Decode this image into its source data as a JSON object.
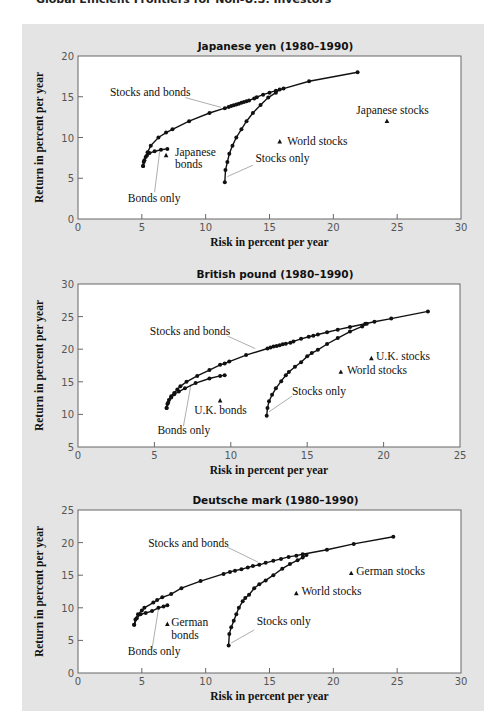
{
  "page": {
    "top_caption": "Global Efficient Frontiers for Non-U.S. Investors"
  },
  "chart_data": [
    {
      "type": "line",
      "title": "Japanese yen (1980–1990)",
      "xlabel": "Risk in percent per year",
      "ylabel": "Return in percent per year",
      "xlim": [
        0,
        30
      ],
      "ylim": [
        0,
        20
      ],
      "xticks": [
        0,
        5,
        10,
        15,
        20,
        25,
        30
      ],
      "yticks": [
        0,
        5,
        10,
        15,
        20
      ],
      "grid": false,
      "plot_box": {
        "left": 78,
        "top": 56,
        "right": 461,
        "bottom": 219
      },
      "series": [
        {
          "name": "Stocks and bonds",
          "points": [
            [
              5.1,
              6.5
            ],
            [
              5.15,
              7.0
            ],
            [
              5.3,
              7.6
            ],
            [
              5.45,
              8.2
            ],
            [
              5.7,
              9.0
            ],
            [
              6.3,
              10.0
            ],
            [
              6.9,
              10.6
            ],
            [
              7.4,
              11.0
            ],
            [
              8.7,
              12.0
            ],
            [
              10.3,
              13.0
            ],
            [
              11.5,
              13.6
            ],
            [
              11.8,
              13.75
            ],
            [
              12.0,
              13.85
            ],
            [
              12.2,
              13.95
            ],
            [
              12.4,
              14.05
            ],
            [
              12.6,
              14.15
            ],
            [
              12.8,
              14.25
            ],
            [
              13.0,
              14.35
            ],
            [
              13.2,
              14.45
            ],
            [
              13.4,
              14.55
            ],
            [
              13.8,
              14.8
            ],
            [
              14.0,
              14.95
            ],
            [
              14.5,
              15.25
            ],
            [
              15.0,
              15.5
            ],
            [
              15.5,
              15.75
            ],
            [
              16.1,
              16.0
            ],
            [
              18.1,
              16.9
            ],
            [
              21.9,
              18.0
            ]
          ]
        },
        {
          "name": "Bonds only",
          "points": [
            [
              5.1,
              6.5
            ],
            [
              5.2,
              7.2
            ],
            [
              5.4,
              7.8
            ],
            [
              5.6,
              8.1
            ],
            [
              6.0,
              8.3
            ],
            [
              6.5,
              8.5
            ],
            [
              7.0,
              8.6
            ]
          ]
        },
        {
          "name": "Stocks only",
          "points": [
            [
              11.5,
              4.5
            ],
            [
              11.55,
              6.0
            ],
            [
              11.7,
              7.0
            ],
            [
              11.85,
              8.0
            ],
            [
              12.1,
              9.0
            ],
            [
              12.4,
              10.0
            ],
            [
              12.8,
              11.0
            ],
            [
              13.2,
              12.0
            ],
            [
              13.7,
              13.0
            ],
            [
              14.3,
              14.0
            ],
            [
              14.9,
              14.9
            ],
            [
              15.5,
              15.5
            ],
            [
              15.8,
              15.9
            ]
          ]
        }
      ],
      "markers": [
        {
          "name": "Japanese bonds",
          "x": 6.9,
          "y": 7.8
        },
        {
          "name": "World stocks",
          "x": 15.8,
          "y": 9.5
        },
        {
          "name": "Japanese stocks",
          "x": 24.2,
          "y": 12.0
        }
      ],
      "annotations": [
        {
          "text": "Stocks and bonds",
          "x": 2.5,
          "y": 15.1,
          "leader": [
            [
              8.4,
              14.9
            ],
            [
              11.2,
              13.7
            ]
          ]
        },
        {
          "text": "Japanese",
          "x": 7.6,
          "y": 7.7
        },
        {
          "text": "bonds",
          "x": 7.6,
          "y": 6.2
        },
        {
          "text": "Bonds only",
          "x": 3.9,
          "y": 2.1,
          "leader": [
            [
              6.0,
              3.3
            ],
            [
              6.4,
              8.3
            ]
          ]
        },
        {
          "text": "World stocks",
          "x": 16.4,
          "y": 9.1
        },
        {
          "text": "Stocks only",
          "x": 13.9,
          "y": 7.0,
          "leader": [
            [
              13.7,
              6.6
            ],
            [
              11.7,
              5.2
            ]
          ]
        },
        {
          "text": "Japanese stocks",
          "x": 21.8,
          "y": 12.9
        }
      ]
    },
    {
      "type": "line",
      "title": "British pound (1980–1990)",
      "xlabel": "Risk in percent per year",
      "ylabel": "Return in percent per year",
      "xlim": [
        0,
        25
      ],
      "ylim": [
        5,
        30
      ],
      "xticks": [
        0,
        5,
        10,
        15,
        20,
        25
      ],
      "yticks": [
        5,
        10,
        15,
        20,
        25,
        30
      ],
      "grid": false,
      "plot_box": {
        "left": 78,
        "top": 284,
        "right": 460,
        "bottom": 447
      },
      "series": [
        {
          "name": "Stocks and bonds",
          "points": [
            [
              5.8,
              11.0
            ],
            [
              5.85,
              11.6
            ],
            [
              5.95,
              12.2
            ],
            [
              6.1,
              12.8
            ],
            [
              6.3,
              13.3
            ],
            [
              6.5,
              13.8
            ],
            [
              6.7,
              14.3
            ],
            [
              7.1,
              15.0
            ],
            [
              7.8,
              15.9
            ],
            [
              8.6,
              16.8
            ],
            [
              9.3,
              17.6
            ],
            [
              9.6,
              17.8
            ],
            [
              9.9,
              18.1
            ],
            [
              11.0,
              19.1
            ],
            [
              12.4,
              20.1
            ],
            [
              12.6,
              20.25
            ],
            [
              12.8,
              20.4
            ],
            [
              13.0,
              20.5
            ],
            [
              13.2,
              20.6
            ],
            [
              13.4,
              20.75
            ],
            [
              13.6,
              20.85
            ],
            [
              13.9,
              21.0
            ],
            [
              14.1,
              21.2
            ],
            [
              14.6,
              21.6
            ],
            [
              15.1,
              21.9
            ],
            [
              15.4,
              22.05
            ],
            [
              15.7,
              22.25
            ],
            [
              16.3,
              22.6
            ],
            [
              17.0,
              23.0
            ],
            [
              17.8,
              23.4
            ],
            [
              18.8,
              23.9
            ],
            [
              19.4,
              24.2
            ],
            [
              20.5,
              24.7
            ],
            [
              22.9,
              25.8
            ]
          ]
        },
        {
          "name": "Bonds only",
          "points": [
            [
              5.8,
              11.0
            ],
            [
              5.9,
              11.8
            ],
            [
              6.1,
              12.6
            ],
            [
              6.3,
              13.1
            ],
            [
              6.6,
              13.5
            ],
            [
              7.0,
              14.0
            ],
            [
              7.7,
              14.8
            ],
            [
              8.6,
              15.5
            ],
            [
              9.3,
              15.9
            ],
            [
              9.6,
              16.0
            ]
          ]
        },
        {
          "name": "Stocks only",
          "points": [
            [
              12.35,
              9.8
            ],
            [
              12.4,
              11.0
            ],
            [
              12.5,
              12.0
            ],
            [
              12.7,
              13.0
            ],
            [
              12.95,
              14.0
            ],
            [
              13.3,
              15.1
            ],
            [
              13.6,
              16.0
            ],
            [
              13.8,
              16.5
            ],
            [
              14.2,
              17.3
            ],
            [
              14.6,
              18.0
            ],
            [
              15.0,
              18.9
            ],
            [
              15.3,
              19.4
            ],
            [
              15.7,
              19.9
            ],
            [
              16.3,
              20.8
            ],
            [
              17.0,
              21.7
            ],
            [
              17.8,
              22.7
            ],
            [
              18.6,
              23.5
            ],
            [
              18.9,
              23.9
            ]
          ]
        }
      ],
      "markers": [
        {
          "name": "U.K. bonds",
          "x": 9.3,
          "y": 12.1
        },
        {
          "name": "World stocks",
          "x": 17.2,
          "y": 16.5
        },
        {
          "name": "U.K. stocks",
          "x": 19.2,
          "y": 18.6
        }
      ],
      "annotations": [
        {
          "text": "Stocks and bonds",
          "x": 4.7,
          "y": 22.2,
          "leader": [
            [
              9.8,
              22.0
            ],
            [
              11.6,
              20.1
            ]
          ]
        },
        {
          "text": "U.K. bonds",
          "x": 7.6,
          "y": 10.1
        },
        {
          "text": "Bonds only",
          "x": 5.2,
          "y": 7.0,
          "leader": [
            [
              6.9,
              8.2
            ],
            [
              7.4,
              14.7
            ]
          ]
        },
        {
          "text": "World stocks",
          "x": 17.6,
          "y": 16.2
        },
        {
          "text": "U.K. stocks",
          "x": 19.5,
          "y": 18.3
        },
        {
          "text": "Stocks only",
          "x": 14.0,
          "y": 13.0,
          "leader": [
            [
              14.0,
              12.8
            ],
            [
              12.5,
              10.4
            ]
          ]
        }
      ]
    },
    {
      "type": "line",
      "title": "Deutsche mark (1980–1990)",
      "xlabel": "Risk in percent per year",
      "ylabel": "Return in percent per year",
      "xlim": [
        0,
        30
      ],
      "ylim": [
        0,
        25
      ],
      "xticks": [
        0,
        5,
        10,
        15,
        20,
        25,
        30
      ],
      "yticks": [
        0,
        5,
        10,
        15,
        20,
        25
      ],
      "grid": false,
      "plot_box": {
        "left": 78,
        "top": 510,
        "right": 461,
        "bottom": 673
      },
      "series": [
        {
          "name": "Stocks and bonds",
          "points": [
            [
              4.4,
              7.4
            ],
            [
              4.5,
              8.2
            ],
            [
              4.7,
              9.0
            ],
            [
              5.0,
              9.6
            ],
            [
              5.2,
              10.0
            ],
            [
              5.9,
              10.8
            ],
            [
              6.2,
              11.2
            ],
            [
              6.6,
              11.6
            ],
            [
              7.3,
              12.1
            ],
            [
              8.1,
              13.0
            ],
            [
              9.6,
              14.1
            ],
            [
              11.4,
              15.2
            ],
            [
              11.9,
              15.5
            ],
            [
              12.3,
              15.7
            ],
            [
              12.8,
              15.9
            ],
            [
              13.3,
              16.2
            ],
            [
              13.7,
              16.4
            ],
            [
              14.2,
              16.6
            ],
            [
              14.7,
              16.9
            ],
            [
              15.3,
              17.2
            ],
            [
              15.9,
              17.5
            ],
            [
              16.5,
              17.8
            ],
            [
              17.1,
              18.0
            ],
            [
              17.6,
              18.2
            ],
            [
              19.5,
              18.9
            ],
            [
              21.6,
              19.8
            ],
            [
              24.7,
              20.9
            ]
          ]
        },
        {
          "name": "Bonds only",
          "points": [
            [
              4.4,
              7.4
            ],
            [
              4.6,
              8.4
            ],
            [
              4.9,
              9.0
            ],
            [
              5.3,
              9.2
            ],
            [
              5.8,
              9.5
            ],
            [
              6.3,
              10.0
            ],
            [
              6.7,
              10.2
            ],
            [
              7.0,
              10.4
            ]
          ]
        },
        {
          "name": "Stocks only",
          "points": [
            [
              11.8,
              4.2
            ],
            [
              11.85,
              6.0
            ],
            [
              12.0,
              7.0
            ],
            [
              12.2,
              8.0
            ],
            [
              12.4,
              9.0
            ],
            [
              12.6,
              10.0
            ],
            [
              12.9,
              11.0
            ],
            [
              13.1,
              11.5
            ],
            [
              13.4,
              12.0
            ],
            [
              13.8,
              13.0
            ],
            [
              14.2,
              13.6
            ],
            [
              14.7,
              14.2
            ],
            [
              15.3,
              15.0
            ],
            [
              16.0,
              16.0
            ],
            [
              16.6,
              16.7
            ],
            [
              17.2,
              17.3
            ],
            [
              17.6,
              17.7
            ],
            [
              17.9,
              18.1
            ]
          ]
        }
      ],
      "markers": [
        {
          "name": "German bonds",
          "x": 7.0,
          "y": 7.5
        },
        {
          "name": "World stocks",
          "x": 17.1,
          "y": 12.2
        },
        {
          "name": "German stocks",
          "x": 21.4,
          "y": 15.3
        }
      ],
      "annotations": [
        {
          "text": "Stocks and bonds",
          "x": 5.5,
          "y": 19.4,
          "leader": [
            [
              11.7,
              19.3
            ],
            [
              14.1,
              17.0
            ]
          ]
        },
        {
          "text": "German",
          "x": 7.3,
          "y": 7.2
        },
        {
          "text": "bonds",
          "x": 7.3,
          "y": 5.2
        },
        {
          "text": "Bonds only",
          "x": 3.9,
          "y": 2.7,
          "leader": [
            [
              5.8,
              3.7
            ],
            [
              6.3,
              9.8
            ]
          ]
        },
        {
          "text": "World stocks",
          "x": 17.5,
          "y": 11.9
        },
        {
          "text": "German stocks",
          "x": 21.8,
          "y": 15.1
        },
        {
          "text": "Stocks only",
          "x": 14.0,
          "y": 7.3,
          "leader": [
            [
              13.8,
              6.6
            ],
            [
              12.0,
              4.6
            ]
          ]
        }
      ]
    }
  ]
}
